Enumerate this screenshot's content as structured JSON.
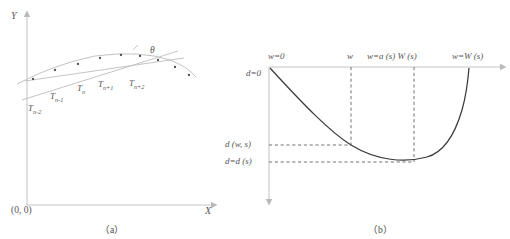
{
  "figure": {
    "panel_a": {
      "caption": "（a）",
      "axis_y_label": "Y",
      "axis_x_label": "X",
      "origin_label": "(0, 0)",
      "angle_label": "θ",
      "point_labels": [
        {
          "base": "T",
          "sub": "n-2"
        },
        {
          "base": "T",
          "sub": "n-1"
        },
        {
          "base": "T",
          "sub": "n"
        },
        {
          "base": "T",
          "sub": "n+1"
        },
        {
          "base": "T",
          "sub": "n+2"
        }
      ]
    },
    "panel_b": {
      "caption": "（b）",
      "top_axis_labels": [
        "w=0",
        "w",
        "w=a (s) W (s)",
        "w=W (s)"
      ],
      "left_axis_labels": [
        "d=0",
        "d (w, s)",
        "d=d (s)"
      ]
    }
  },
  "chart_data": [
    {
      "type": "scatter",
      "title": "(a)",
      "xlabel": "X",
      "ylabel": "Y",
      "origin": "(0, 0)",
      "annotations": [
        "θ"
      ],
      "series": [
        {
          "name": "trajectory points",
          "x": [
            20,
            42,
            62,
            83,
            104,
            122,
            140,
            158,
            175
          ],
          "y": [
            82,
            72,
            66,
            60,
            56,
            57,
            60,
            66,
            74
          ],
          "labels": [
            "T n-2",
            "T n-1",
            "T n",
            "T n+1",
            "T n+2",
            "",
            "",
            "",
            ""
          ]
        }
      ],
      "lines": [
        {
          "name": "secant-line",
          "x1": 18,
          "y1": 88,
          "x2": 170,
          "y2": 48
        },
        {
          "name": "tangent-line",
          "x1": 22,
          "y1": 72,
          "x2": 178,
          "y2": 58
        }
      ],
      "grid": false,
      "legend": "none"
    },
    {
      "type": "line",
      "title": "(b)",
      "xlabel": "w",
      "ylabel": "d",
      "x_ticks": [
        "w=0",
        "w",
        "w=a (s) W (s)",
        "w=W (s)"
      ],
      "x_tick_positions": [
        0,
        0.34,
        0.62,
        0.94
      ],
      "y_ticks": [
        "d=0",
        "d (w, s)",
        "d=d (s)"
      ],
      "y_tick_positions": [
        0,
        0.63,
        0.88
      ],
      "values": {
        "x": [
          0.0,
          0.1,
          0.2,
          0.34,
          0.45,
          0.55,
          0.62,
          0.72,
          0.82,
          0.9,
          0.94
        ],
        "d": [
          0.0,
          0.22,
          0.41,
          0.63,
          0.76,
          0.85,
          0.88,
          0.85,
          0.7,
          0.38,
          0.0
        ]
      },
      "dashed_guides": [
        {
          "name": "w-vertical",
          "x": 0.34,
          "from_d": 0.0,
          "to_d": 0.63
        },
        {
          "name": "w-horizontal",
          "d": 0.63,
          "from_x": 0.0,
          "to_x": 0.34
        },
        {
          "name": "min-vertical",
          "x": 0.62,
          "from_d": 0.0,
          "to_d": 0.88
        },
        {
          "name": "min-horizontal",
          "d": 0.88,
          "from_x": 0.0,
          "to_x": 0.62
        }
      ],
      "grid": false,
      "legend": "none"
    }
  ]
}
